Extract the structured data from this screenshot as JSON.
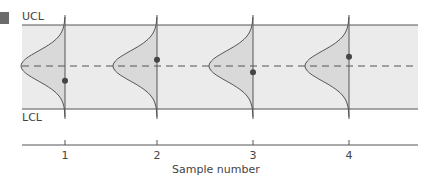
{
  "chart_data": {
    "type": "scatter",
    "title": "",
    "xlabel": "Sample number",
    "ylabel": "",
    "categories": [
      "1",
      "2",
      "3",
      "4"
    ],
    "limits": {
      "upper_label": "UCL",
      "lower_label": "LCL",
      "center_style": "dashed"
    },
    "values": [
      -0.35,
      0.15,
      -0.15,
      0.22
    ],
    "ylim": [
      -1,
      1
    ],
    "annotations": [
      "Normal distribution curve drawn at each sample"
    ],
    "grid": false,
    "legend": null
  },
  "labels": {
    "ucl": "UCL",
    "lcl": "LCL",
    "x_axis_title": "Sample number",
    "ticks": [
      "1",
      "2",
      "3",
      "4"
    ]
  },
  "colors": {
    "band_fill": "#ebebeb",
    "curve_fill": "#d9d9d9",
    "line": "#555555",
    "point": "#444444",
    "marker": "#6b6b6b"
  }
}
